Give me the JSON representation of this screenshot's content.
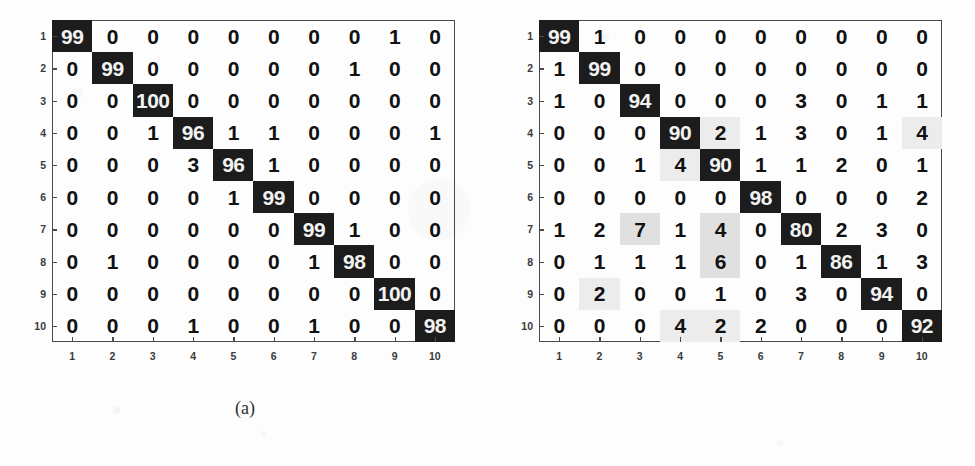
{
  "figure": {
    "background_color": "#fdfdfd",
    "diagonal_color": "#1c1c1c",
    "diagonal_text_color": "#f2f2f2",
    "offdiagonal_text_color": "#111111",
    "axis_color": "#4a4a4a"
  },
  "panels": [
    {
      "id": "panel-a",
      "caption": "(a)",
      "x_tick_labels": [
        "1",
        "2",
        "3",
        "4",
        "5",
        "6",
        "7",
        "8",
        "9",
        "10"
      ],
      "y_tick_labels": [
        "1",
        "2",
        "3",
        "4",
        "5",
        "6",
        "7",
        "8",
        "9",
        "10"
      ]
    },
    {
      "id": "panel-b",
      "caption": "(b)",
      "x_tick_labels": [
        "1",
        "2",
        "3",
        "4",
        "5",
        "6",
        "7",
        "8",
        "9",
        "10"
      ],
      "y_tick_labels": [
        "1",
        "2",
        "3",
        "4",
        "5",
        "6",
        "7",
        "8",
        "9",
        "10"
      ]
    }
  ],
  "chart_data": [
    {
      "type": "heatmap",
      "id": "confusion-matrix-a",
      "title": "(a)",
      "xlabel": "",
      "ylabel": "",
      "categories": [
        "1",
        "2",
        "3",
        "4",
        "5",
        "6",
        "7",
        "8",
        "9",
        "10"
      ],
      "row_categories": [
        "1",
        "2",
        "3",
        "4",
        "5",
        "6",
        "7",
        "8",
        "9",
        "10"
      ],
      "units": "percent",
      "grid": false,
      "legend": "none",
      "values": [
        [
          99,
          0,
          0,
          0,
          0,
          0,
          0,
          0,
          1,
          0
        ],
        [
          0,
          99,
          0,
          0,
          0,
          0,
          0,
          1,
          0,
          0
        ],
        [
          0,
          0,
          100,
          0,
          0,
          0,
          0,
          0,
          0,
          0
        ],
        [
          0,
          0,
          1,
          96,
          1,
          1,
          0,
          0,
          0,
          1
        ],
        [
          0,
          0,
          0,
          3,
          96,
          1,
          0,
          0,
          0,
          0
        ],
        [
          0,
          0,
          0,
          0,
          1,
          99,
          0,
          0,
          0,
          0
        ],
        [
          0,
          0,
          0,
          0,
          0,
          0,
          99,
          1,
          0,
          0
        ],
        [
          0,
          1,
          0,
          0,
          0,
          0,
          1,
          98,
          0,
          0
        ],
        [
          0,
          0,
          0,
          0,
          0,
          0,
          0,
          0,
          100,
          0
        ],
        [
          0,
          0,
          0,
          1,
          0,
          0,
          1,
          0,
          0,
          98
        ]
      ],
      "shading": [
        [
          0,
          0,
          0,
          0,
          0,
          0,
          0,
          0,
          0,
          0
        ],
        [
          0,
          0,
          0,
          0,
          0,
          0,
          0,
          0,
          0,
          0
        ],
        [
          0,
          0,
          0,
          0,
          0,
          0,
          0,
          0,
          0,
          0
        ],
        [
          0,
          0,
          0,
          0,
          0,
          0,
          0,
          0,
          0,
          0
        ],
        [
          0,
          0,
          0,
          0,
          0,
          0,
          0,
          0,
          0,
          0
        ],
        [
          0,
          0,
          0,
          0,
          0,
          0,
          0,
          0,
          0,
          0
        ],
        [
          0,
          0,
          0,
          0,
          0,
          0,
          0,
          0,
          0,
          0
        ],
        [
          0,
          0,
          0,
          0,
          0,
          0,
          0,
          0,
          0,
          0
        ],
        [
          0,
          0,
          0,
          0,
          0,
          0,
          0,
          0,
          0,
          0
        ],
        [
          0,
          0,
          0,
          0,
          0,
          0,
          0,
          0,
          0,
          0
        ]
      ]
    },
    {
      "type": "heatmap",
      "id": "confusion-matrix-b",
      "title": "(b)",
      "xlabel": "",
      "ylabel": "",
      "categories": [
        "1",
        "2",
        "3",
        "4",
        "5",
        "6",
        "7",
        "8",
        "9",
        "10"
      ],
      "row_categories": [
        "1",
        "2",
        "3",
        "4",
        "5",
        "6",
        "7",
        "8",
        "9",
        "10"
      ],
      "units": "percent",
      "grid": false,
      "legend": "none",
      "values": [
        [
          99,
          1,
          0,
          0,
          0,
          0,
          0,
          0,
          0,
          0
        ],
        [
          1,
          99,
          0,
          0,
          0,
          0,
          0,
          0,
          0,
          0
        ],
        [
          1,
          0,
          94,
          0,
          0,
          0,
          3,
          0,
          1,
          1
        ],
        [
          0,
          0,
          0,
          90,
          2,
          1,
          3,
          0,
          1,
          4
        ],
        [
          0,
          0,
          1,
          4,
          90,
          1,
          1,
          2,
          0,
          1
        ],
        [
          0,
          0,
          0,
          0,
          0,
          98,
          0,
          0,
          0,
          2
        ],
        [
          1,
          2,
          7,
          1,
          4,
          0,
          80,
          2,
          3,
          0
        ],
        [
          0,
          1,
          1,
          1,
          6,
          0,
          1,
          86,
          1,
          3
        ],
        [
          0,
          2,
          0,
          0,
          1,
          0,
          3,
          0,
          94,
          0
        ],
        [
          0,
          0,
          0,
          4,
          2,
          2,
          0,
          0,
          0,
          92
        ]
      ],
      "shading": [
        [
          0,
          0,
          0,
          0,
          0,
          0,
          0,
          0,
          0,
          0
        ],
        [
          0,
          0,
          0,
          0,
          0,
          0,
          0,
          0,
          0,
          0
        ],
        [
          0,
          0,
          0,
          0,
          0,
          0,
          0,
          0,
          0,
          0
        ],
        [
          0,
          0,
          0,
          0,
          1,
          0,
          0,
          0,
          0,
          1
        ],
        [
          0,
          0,
          0,
          1,
          0,
          0,
          0,
          0,
          0,
          0
        ],
        [
          0,
          0,
          0,
          0,
          0,
          0,
          0,
          0,
          0,
          0
        ],
        [
          0,
          0,
          2,
          0,
          2,
          0,
          0,
          0,
          0,
          0
        ],
        [
          0,
          0,
          0,
          0,
          2,
          0,
          0,
          0,
          0,
          0
        ],
        [
          0,
          1,
          0,
          0,
          0,
          0,
          0,
          0,
          0,
          0
        ],
        [
          0,
          0,
          0,
          1,
          1,
          0,
          0,
          0,
          0,
          0
        ]
      ]
    }
  ]
}
